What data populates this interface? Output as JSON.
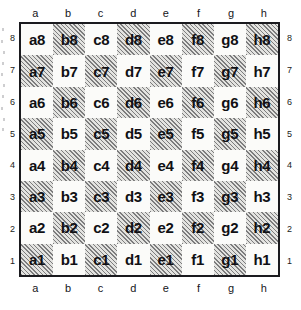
{
  "figure": {
    "kind": "chessboard-coordinate-diagram"
  },
  "files": [
    "a",
    "b",
    "c",
    "d",
    "e",
    "f",
    "g",
    "h"
  ],
  "ranks": [
    "8",
    "7",
    "6",
    "5",
    "4",
    "3",
    "2",
    "1"
  ],
  "colors": {
    "light_square": "#fbfbf9",
    "dark_square": "#e3e3e0",
    "hatch": "#28282c",
    "border": "#1a1a1e",
    "label_text": "#101014",
    "coordinate_text": "#15151a"
  },
  "chart_data": {
    "type": "table",
    "xlabel": "file",
    "ylabel": "rank",
    "columns": [
      "a",
      "b",
      "c",
      "d",
      "e",
      "f",
      "g",
      "h"
    ],
    "row_headers": [
      "8",
      "7",
      "6",
      "5",
      "4",
      "3",
      "2",
      "1"
    ],
    "legend": [
      "light square",
      "dark square (hatched)"
    ],
    "note": "Square shading alternates; a1 and h8 are dark, a8 and h1 are light.",
    "rows": [
      {
        "rank": "8",
        "cells": [
          {
            "label": "a8",
            "shade": "light"
          },
          {
            "label": "b8",
            "shade": "dark"
          },
          {
            "label": "c8",
            "shade": "light"
          },
          {
            "label": "d8",
            "shade": "dark"
          },
          {
            "label": "e8",
            "shade": "light"
          },
          {
            "label": "f8",
            "shade": "dark"
          },
          {
            "label": "g8",
            "shade": "light"
          },
          {
            "label": "h8",
            "shade": "dark"
          }
        ]
      },
      {
        "rank": "7",
        "cells": [
          {
            "label": "a7",
            "shade": "dark"
          },
          {
            "label": "b7",
            "shade": "light"
          },
          {
            "label": "c7",
            "shade": "dark"
          },
          {
            "label": "d7",
            "shade": "light"
          },
          {
            "label": "e7",
            "shade": "dark"
          },
          {
            "label": "f7",
            "shade": "light"
          },
          {
            "label": "g7",
            "shade": "dark"
          },
          {
            "label": "h7",
            "shade": "light"
          }
        ]
      },
      {
        "rank": "6",
        "cells": [
          {
            "label": "a6",
            "shade": "light"
          },
          {
            "label": "b6",
            "shade": "dark"
          },
          {
            "label": "c6",
            "shade": "light"
          },
          {
            "label": "d6",
            "shade": "dark"
          },
          {
            "label": "e6",
            "shade": "light"
          },
          {
            "label": "f6",
            "shade": "dark"
          },
          {
            "label": "g6",
            "shade": "light"
          },
          {
            "label": "h6",
            "shade": "dark"
          }
        ]
      },
      {
        "rank": "5",
        "cells": [
          {
            "label": "a5",
            "shade": "dark"
          },
          {
            "label": "b5",
            "shade": "light"
          },
          {
            "label": "c5",
            "shade": "dark"
          },
          {
            "label": "d5",
            "shade": "light"
          },
          {
            "label": "e5",
            "shade": "dark"
          },
          {
            "label": "f5",
            "shade": "light"
          },
          {
            "label": "g5",
            "shade": "dark"
          },
          {
            "label": "h5",
            "shade": "light"
          }
        ]
      },
      {
        "rank": "4",
        "cells": [
          {
            "label": "a4",
            "shade": "light"
          },
          {
            "label": "b4",
            "shade": "dark"
          },
          {
            "label": "c4",
            "shade": "light"
          },
          {
            "label": "d4",
            "shade": "dark"
          },
          {
            "label": "e4",
            "shade": "light"
          },
          {
            "label": "f4",
            "shade": "dark"
          },
          {
            "label": "g4",
            "shade": "light"
          },
          {
            "label": "h4",
            "shade": "dark"
          }
        ]
      },
      {
        "rank": "3",
        "cells": [
          {
            "label": "a3",
            "shade": "dark"
          },
          {
            "label": "b3",
            "shade": "light"
          },
          {
            "label": "c3",
            "shade": "dark"
          },
          {
            "label": "d3",
            "shade": "light"
          },
          {
            "label": "e3",
            "shade": "dark"
          },
          {
            "label": "f3",
            "shade": "light"
          },
          {
            "label": "g3",
            "shade": "dark"
          },
          {
            "label": "h3",
            "shade": "light"
          }
        ]
      },
      {
        "rank": "2",
        "cells": [
          {
            "label": "a2",
            "shade": "light"
          },
          {
            "label": "b2",
            "shade": "dark"
          },
          {
            "label": "c2",
            "shade": "light"
          },
          {
            "label": "d2",
            "shade": "dark"
          },
          {
            "label": "e2",
            "shade": "light"
          },
          {
            "label": "f2",
            "shade": "dark"
          },
          {
            "label": "g2",
            "shade": "light"
          },
          {
            "label": "h2",
            "shade": "dark"
          }
        ]
      },
      {
        "rank": "1",
        "cells": [
          {
            "label": "a1",
            "shade": "dark"
          },
          {
            "label": "b1",
            "shade": "light"
          },
          {
            "label": "c1",
            "shade": "dark"
          },
          {
            "label": "d1",
            "shade": "light"
          },
          {
            "label": "e1",
            "shade": "dark"
          },
          {
            "label": "f1",
            "shade": "light"
          },
          {
            "label": "g1",
            "shade": "dark"
          },
          {
            "label": "h1",
            "shade": "light"
          }
        ]
      }
    ]
  }
}
